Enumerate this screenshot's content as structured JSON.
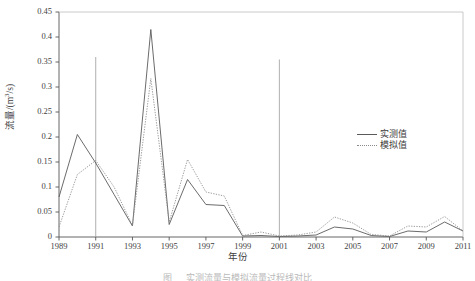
{
  "chart_data": {
    "type": "line",
    "title": "",
    "xlabel": "年份",
    "ylabel": "流量/(m³/s)",
    "xlim": [
      1989,
      2011
    ],
    "ylim": [
      0,
      0.45
    ],
    "grid": false,
    "legend_position": "center-right",
    "x": [
      1989,
      1990,
      1991,
      1992,
      1993,
      1994,
      1995,
      1996,
      1997,
      1998,
      1999,
      2000,
      2001,
      2002,
      2003,
      2004,
      2005,
      2006,
      2007,
      2008,
      2009,
      2010,
      2011
    ],
    "xtick_labels": [
      "1989",
      "1991",
      "1993",
      "1995",
      "1997",
      "1999",
      "2001",
      "2003",
      "2005",
      "2007",
      "2009",
      "2011"
    ],
    "xtick_values": [
      1989,
      1991,
      1993,
      1995,
      1997,
      1999,
      2001,
      2003,
      2005,
      2007,
      2009,
      2011
    ],
    "ytick_labels": [
      "0",
      "0.05",
      "0.1",
      "0.15",
      "0.2",
      "0.25",
      "0.3",
      "0.35",
      "0.4",
      "0.45"
    ],
    "ytick_values": [
      0,
      0.05,
      0.1,
      0.15,
      0.2,
      0.25,
      0.3,
      0.35,
      0.4,
      0.45
    ],
    "series": [
      {
        "name": "实测值",
        "style": "solid",
        "color": "#5a5a5a",
        "values": [
          0.08,
          0.205,
          0.148,
          0.085,
          0.022,
          0.415,
          0.025,
          0.115,
          0.065,
          0.063,
          0.002,
          0.003,
          0.001,
          0.002,
          0.004,
          0.02,
          0.016,
          0.003,
          0.001,
          0.012,
          0.01,
          0.03,
          0.012
        ]
      },
      {
        "name": "模拟值",
        "style": "dotted",
        "color": "#909090",
        "values": [
          0.02,
          0.125,
          0.153,
          0.1,
          0.023,
          0.317,
          0.03,
          0.155,
          0.09,
          0.082,
          0.003,
          0.01,
          0.002,
          0.004,
          0.01,
          0.04,
          0.028,
          0.005,
          0.002,
          0.022,
          0.02,
          0.041,
          0.012
        ]
      }
    ],
    "annotations": [
      {
        "name": "vertical-line-1991",
        "x": 1991,
        "y_top": 0.36,
        "y_bottom": 0.0
      },
      {
        "name": "vertical-line-2001",
        "x": 2001,
        "y_top": 0.355,
        "y_bottom": 0.0
      }
    ]
  },
  "legend": {
    "items": [
      {
        "label": "实测值",
        "style": "solid"
      },
      {
        "label": "模拟值",
        "style": "dotted"
      }
    ]
  },
  "axes": {
    "y_title": "流量/(m³/s)",
    "y_title_main": "流量/(m",
    "y_title_sup": "3",
    "y_title_tail": "/s)",
    "x_title": "年份"
  },
  "caption": {
    "text": "图    　 实测流量与模拟流量过程线对比"
  }
}
